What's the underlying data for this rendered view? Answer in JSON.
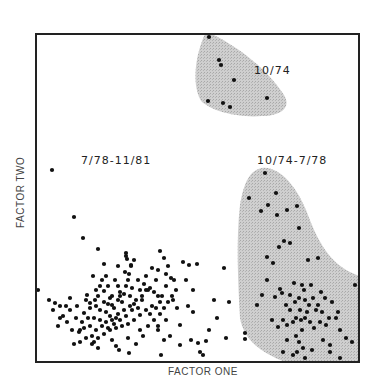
{
  "chart_data": {
    "type": "scatter",
    "title": "",
    "xlabel": "FACTOR ONE",
    "ylabel": "FACTOR TWO",
    "grid": false,
    "ticks": false,
    "legend": null,
    "coordinate_note": "axes unlabeled; points given in plot pixel coords",
    "frame": {
      "x0": 36,
      "y0": 34,
      "x1": 359,
      "y1": 362
    },
    "annotations": [
      {
        "text": "10/74",
        "x": 254,
        "y": 70
      },
      {
        "text": "7/78-11/81",
        "x": 81,
        "y": 160
      },
      {
        "text": "10/74-7/78",
        "x": 257,
        "y": 160
      }
    ],
    "regions": [
      {
        "name": "10/74",
        "fill": "#c8c8c8"
      },
      {
        "name": "10/74-7/78",
        "fill": "#c8c8c8"
      }
    ],
    "series": [
      {
        "name": "10/74",
        "points": [
          [
            209,
            37
          ],
          [
            219,
            60
          ],
          [
            221,
            65
          ],
          [
            234,
            80
          ],
          [
            208,
            101
          ],
          [
            223,
            103
          ],
          [
            230,
            107
          ],
          [
            267,
            98
          ]
        ]
      },
      {
        "name": "10/74-7/78",
        "points": [
          [
            265,
            173
          ],
          [
            249,
            198
          ],
          [
            276,
            193
          ],
          [
            268,
            205
          ],
          [
            261,
            211
          ],
          [
            277,
            215
          ],
          [
            287,
            210
          ],
          [
            297,
            206
          ],
          [
            299,
            228
          ],
          [
            284,
            241
          ],
          [
            279,
            247
          ],
          [
            290,
            243
          ],
          [
            267,
            257
          ],
          [
            273,
            263
          ],
          [
            318,
            258
          ],
          [
            267,
            280
          ],
          [
            308,
            260
          ],
          [
            294,
            283
          ],
          [
            302,
            285
          ],
          [
            304,
            290
          ],
          [
            311,
            285
          ],
          [
            262,
            295
          ],
          [
            275,
            297
          ],
          [
            321,
            292
          ],
          [
            257,
            305
          ],
          [
            282,
            293
          ],
          [
            280,
            289
          ],
          [
            290,
            295
          ],
          [
            299,
            298
          ],
          [
            295,
            302
          ],
          [
            305,
            300
          ],
          [
            313,
            298
          ],
          [
            318,
            305
          ],
          [
            325,
            298
          ],
          [
            332,
            302
          ],
          [
            338,
            312
          ],
          [
            329,
            318
          ],
          [
            320,
            322
          ],
          [
            305,
            318
          ],
          [
            296,
            318
          ],
          [
            290,
            310
          ],
          [
            286,
            305
          ],
          [
            300,
            310
          ],
          [
            307,
            312
          ],
          [
            310,
            322
          ],
          [
            314,
            328
          ],
          [
            302,
            330
          ],
          [
            296,
            336
          ],
          [
            299,
            342
          ],
          [
            303,
            348
          ],
          [
            293,
            355
          ],
          [
            312,
            350
          ],
          [
            330,
            345
          ],
          [
            336,
            318
          ],
          [
            340,
            330
          ],
          [
            287,
            325
          ],
          [
            278,
            327
          ],
          [
            283,
            320
          ],
          [
            293,
            322
          ],
          [
            272,
            320
          ],
          [
            245,
            333
          ],
          [
            245,
            339
          ],
          [
            330,
            352
          ],
          [
            346,
            338
          ],
          [
            352,
            342
          ],
          [
            340,
            358
          ],
          [
            323,
            340
          ],
          [
            283,
            352
          ],
          [
            287,
            340
          ],
          [
            297,
            352
          ],
          [
            305,
            358
          ],
          [
            355,
            285
          ],
          [
            316,
            310
          ],
          [
            322,
            312
          ],
          [
            326,
            325
          ],
          [
            309,
            305
          ],
          [
            301,
            320
          ]
        ]
      },
      {
        "name": "7/78-11/81",
        "points": [
          [
            52,
            170
          ],
          [
            74,
            217
          ],
          [
            83,
            238
          ],
          [
            98,
            249
          ],
          [
            126,
            253
          ],
          [
            126,
            256
          ],
          [
            160,
            251
          ],
          [
            164,
            258
          ],
          [
            127,
            259
          ],
          [
            104,
            264
          ],
          [
            131,
            265
          ],
          [
            38,
            290
          ],
          [
            49,
            300
          ],
          [
            55,
            303
          ],
          [
            53,
            310
          ],
          [
            60,
            306
          ],
          [
            63,
            316
          ],
          [
            70,
            310
          ],
          [
            77,
            306
          ],
          [
            67,
            322
          ],
          [
            72,
            330
          ],
          [
            79,
            332
          ],
          [
            80,
            330
          ],
          [
            84,
            313
          ],
          [
            90,
            303
          ],
          [
            95,
            300
          ],
          [
            98,
            296
          ],
          [
            104,
            291
          ],
          [
            108,
            286
          ],
          [
            110,
            298
          ],
          [
            112,
            305
          ],
          [
            118,
            300
          ],
          [
            120,
            292
          ],
          [
            126,
            286
          ],
          [
            128,
            280
          ],
          [
            129,
            274
          ],
          [
            131,
            266
          ],
          [
            125,
            272
          ],
          [
            115,
            280
          ],
          [
            102,
            280
          ],
          [
            96,
            290
          ],
          [
            87,
            295
          ],
          [
            86,
            300
          ],
          [
            90,
            308
          ],
          [
            94,
            318
          ],
          [
            100,
            320
          ],
          [
            106,
            322
          ],
          [
            112,
            320
          ],
          [
            118,
            314
          ],
          [
            124,
            310
          ],
          [
            130,
            306
          ],
          [
            136,
            300
          ],
          [
            142,
            296
          ],
          [
            146,
            290
          ],
          [
            150,
            288
          ],
          [
            154,
            292
          ],
          [
            158,
            296
          ],
          [
            160,
            302
          ],
          [
            152,
            306
          ],
          [
            146,
            310
          ],
          [
            140,
            315
          ],
          [
            134,
            320
          ],
          [
            128,
            324
          ],
          [
            122,
            326
          ],
          [
            116,
            328
          ],
          [
            110,
            330
          ],
          [
            104,
            334
          ],
          [
            98,
            338
          ],
          [
            92,
            336
          ],
          [
            86,
            338
          ],
          [
            80,
            342
          ],
          [
            92,
            344
          ],
          [
            112,
            340
          ],
          [
            128,
            338
          ],
          [
            140,
            330
          ],
          [
            148,
            326
          ],
          [
            154,
            320
          ],
          [
            160,
            314
          ],
          [
            164,
            308
          ],
          [
            168,
            302
          ],
          [
            172,
            296
          ],
          [
            176,
            290
          ],
          [
            174,
            280
          ],
          [
            166,
            274
          ],
          [
            158,
            270
          ],
          [
            152,
            268
          ],
          [
            146,
            276
          ],
          [
            138,
            280
          ],
          [
            132,
            288
          ],
          [
            120,
            296
          ],
          [
            108,
            304
          ],
          [
            100,
            310
          ],
          [
            96,
            306
          ],
          [
            88,
            318
          ],
          [
            82,
            322
          ],
          [
            76,
            318
          ],
          [
            70,
            298
          ],
          [
            66,
            306
          ],
          [
            60,
            318
          ],
          [
            58,
            326
          ],
          [
            106,
            312
          ],
          [
            114,
            308
          ],
          [
            122,
            302
          ],
          [
            130,
            296
          ],
          [
            134,
            304
          ],
          [
            138,
            308
          ],
          [
            142,
            300
          ],
          [
            116,
            318
          ],
          [
            110,
            316
          ],
          [
            104,
            302
          ],
          [
            112,
            296
          ],
          [
            118,
            286
          ],
          [
            124,
            294
          ],
          [
            132,
            310
          ],
          [
            126,
            316
          ],
          [
            120,
            320
          ],
          [
            114,
            324
          ],
          [
            108,
            328
          ],
          [
            102,
            326
          ],
          [
            96,
            330
          ],
          [
            90,
            326
          ],
          [
            84,
            328
          ],
          [
            150,
            314
          ],
          [
            156,
            308
          ],
          [
            162,
            296
          ],
          [
            166,
            286
          ],
          [
            171,
            278
          ],
          [
            183,
            262
          ],
          [
            189,
            265
          ],
          [
            197,
            264
          ],
          [
            193,
            290
          ],
          [
            186,
            280
          ],
          [
            173,
            300
          ],
          [
            177,
            308
          ],
          [
            166,
            320
          ],
          [
            158,
            330
          ],
          [
            143,
            336
          ],
          [
            136,
            344
          ],
          [
            116,
            346
          ],
          [
            94,
            342
          ],
          [
            74,
            344
          ],
          [
            98,
            348
          ],
          [
            164,
            340
          ],
          [
            180,
            345
          ],
          [
            191,
            340
          ],
          [
            198,
            343
          ],
          [
            206,
            341
          ],
          [
            226,
            338
          ],
          [
            224,
            268
          ],
          [
            214,
            300
          ],
          [
            229,
            302
          ],
          [
            217,
            318
          ],
          [
            209,
            330
          ],
          [
            193,
            312
          ],
          [
            188,
            306
          ],
          [
            180,
            325
          ],
          [
            170,
            336
          ],
          [
            200,
            352
          ],
          [
            203,
            355
          ],
          [
            161,
            355
          ],
          [
            129,
            353
          ],
          [
            119,
            350
          ],
          [
            148,
            290
          ],
          [
            156,
            280
          ],
          [
            168,
            266
          ],
          [
            144,
            284
          ],
          [
            140,
            290
          ],
          [
            100,
            286
          ],
          [
            93,
            276
          ],
          [
            134,
            260
          ],
          [
            118,
            266
          ],
          [
            106,
            276
          ],
          [
            158,
            326
          ]
        ]
      }
    ]
  }
}
